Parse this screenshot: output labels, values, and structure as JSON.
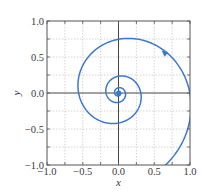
{
  "chart_data": {
    "type": "line",
    "title": "",
    "xlabel": "x",
    "ylabel": "y",
    "xlim": [
      -1.0,
      1.0
    ],
    "ylim": [
      -1.0,
      1.0
    ],
    "grid": true,
    "legend": null,
    "xticks": [
      -1.0,
      -0.5,
      0.0,
      0.5,
      1.0
    ],
    "yticks": [
      -1.0,
      -0.5,
      0.0,
      0.5,
      1.0
    ],
    "xtick_labels": [
      "−1.0",
      "−0.5",
      "0.0",
      "0.5",
      "1.0"
    ],
    "ytick_labels": [
      "−1.0",
      "−0.5",
      "0.0",
      "0.5",
      "1.0"
    ],
    "minor_grid_step": 0.25,
    "series": [
      {
        "name": "phase trajectory (inward spiral)",
        "description": "Logarithmic spiral decaying toward the origin, counter-clockwise, entering from bottom near (0.7,-1.0)",
        "approx_points": [
          {
            "x": 0.7,
            "y": -1.0
          },
          {
            "x": 1.0,
            "y": -0.2
          },
          {
            "x": 0.65,
            "y": 0.55
          },
          {
            "x": 0.2,
            "y": 0.75
          },
          {
            "x": -0.5,
            "y": 0.05
          },
          {
            "x": -0.1,
            "y": -0.4
          },
          {
            "x": 0.28,
            "y": -0.05
          },
          {
            "x": 0.05,
            "y": 0.2
          },
          {
            "x": -0.13,
            "y": 0.0
          },
          {
            "x": 0.0,
            "y": -0.08
          },
          {
            "x": 0.06,
            "y": 0.0
          },
          {
            "x": 0.0,
            "y": 0.0
          }
        ],
        "color": "#3b78d0",
        "direction_arrow_at": {
          "x": 0.65,
          "y": 0.55
        },
        "fixed_point": {
          "x": 0.0,
          "y": 0.0
        }
      }
    ]
  },
  "spiral_params": {
    "a": 1.2,
    "b": -0.185,
    "theta_start": -1.0,
    "theta_end": 26.0,
    "rotation": 0.0
  },
  "axes": {
    "x_label": "x",
    "y_label": "y"
  },
  "colors": {
    "curve": "#3b78d0",
    "frame": "#555555",
    "grid": "#c9c9c9",
    "zero_lines": "#444444",
    "text": "#3a3a3a"
  }
}
